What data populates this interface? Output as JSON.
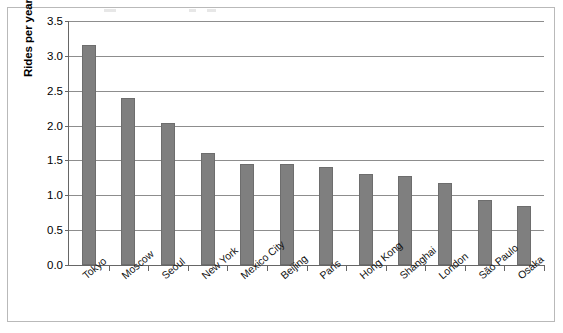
{
  "chart_data": {
    "type": "bar",
    "title": "",
    "xlabel": "",
    "ylabel": "Rides per year in billions",
    "ylim": [
      0.0,
      3.5
    ],
    "ytick_labels": [
      "0.0",
      "0.5",
      "1.0",
      "1.5",
      "2.0",
      "2.5",
      "3.0",
      "3.5"
    ],
    "ytick_values": [
      0.0,
      0.5,
      1.0,
      1.5,
      2.0,
      2.5,
      3.0,
      3.5
    ],
    "grid": true,
    "legend": false,
    "bar_color": "#7f7f7f",
    "categories": [
      "Tokyo",
      "Moscow",
      "Seoul",
      "New York",
      "Mexico City",
      "Beijing",
      "Paris",
      "Hong Kong",
      "Shanghai",
      "London",
      "São Paulo",
      "Osaka"
    ],
    "values": [
      3.15,
      2.4,
      2.03,
      1.6,
      1.45,
      1.45,
      1.4,
      1.3,
      1.27,
      1.17,
      0.93,
      0.85
    ]
  }
}
